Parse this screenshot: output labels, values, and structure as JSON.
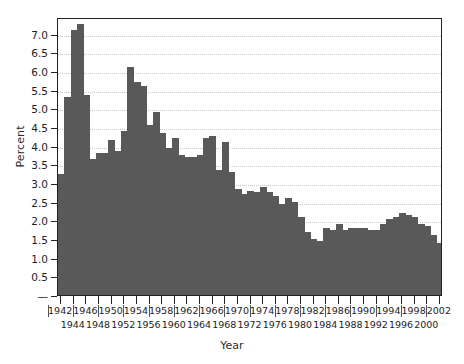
{
  "chart_data": {
    "type": "bar",
    "title": "",
    "xlabel": "Year",
    "ylabel": "Percent",
    "xlim": [
      1941.5,
      2002.5
    ],
    "ylim": [
      0,
      7.45
    ],
    "grid": true,
    "legend": null,
    "bar_color": "#595959",
    "ytick_labels": [
      "—",
      "0.5",
      "1.0",
      "1.5",
      "2.0",
      "2.5",
      "3.0",
      "3.5",
      "4.0",
      "4.5",
      "5.0",
      "5.5",
      "6.0",
      "6.5",
      "7.0"
    ],
    "ytick_values": [
      0,
      0.5,
      1.0,
      1.5,
      2.0,
      2.5,
      3.0,
      3.5,
      4.0,
      4.5,
      5.0,
      5.5,
      6.0,
      6.5,
      7.0
    ],
    "xtick_labels": [
      "1942",
      "1944",
      "1946",
      "1948",
      "1950",
      "1952",
      "1954",
      "1956",
      "1958",
      "1960",
      "1962",
      "1964",
      "1966",
      "1968",
      "1970",
      "1972",
      "1974",
      "1976",
      "1978",
      "1980",
      "1982",
      "1984",
      "1986",
      "1988",
      "1990",
      "1992",
      "1994",
      "1996",
      "1998",
      "2000",
      "2002"
    ],
    "categories": [
      1942,
      1943,
      1944,
      1945,
      1946,
      1947,
      1948,
      1949,
      1950,
      1951,
      1952,
      1953,
      1954,
      1955,
      1956,
      1957,
      1958,
      1959,
      1960,
      1961,
      1962,
      1963,
      1964,
      1965,
      1966,
      1967,
      1968,
      1969,
      1970,
      1971,
      1972,
      1973,
      1974,
      1975,
      1976,
      1977,
      1978,
      1979,
      1980,
      1981,
      1982,
      1983,
      1984,
      1985,
      1986,
      1987,
      1988,
      1989,
      1990,
      1991,
      1992,
      1993,
      1994,
      1995,
      1996,
      1997,
      1998,
      1999,
      2000,
      2001,
      2002
    ],
    "values": [
      3.25,
      5.3,
      7.1,
      7.25,
      5.35,
      3.65,
      3.8,
      3.8,
      4.15,
      3.85,
      4.4,
      6.1,
      5.7,
      5.6,
      4.55,
      4.9,
      4.35,
      3.95,
      4.2,
      3.75,
      3.7,
      3.7,
      3.75,
      4.2,
      4.25,
      3.35,
      4.1,
      3.3,
      2.85,
      2.7,
      2.8,
      2.75,
      2.9,
      2.75,
      2.65,
      2.45,
      2.6,
      2.5,
      2.1,
      1.7,
      1.5,
      1.45,
      1.8,
      1.75,
      1.9,
      1.75,
      1.8,
      1.8,
      1.8,
      1.75,
      1.75,
      1.9,
      2.05,
      2.1,
      2.2,
      2.15,
      2.1,
      1.9,
      1.85,
      1.6,
      1.4
    ]
  }
}
